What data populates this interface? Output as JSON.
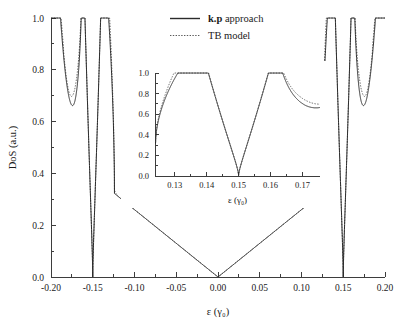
{
  "chart_data": {
    "type": "line",
    "title": "",
    "xlabel": "ε (γ₀)",
    "ylabel": "DoS (a.u.)",
    "xlim": [
      -0.2,
      0.2
    ],
    "ylim": [
      0.0,
      1.0
    ],
    "xticks": [
      -0.2,
      -0.15,
      -0.1,
      -0.05,
      0.0,
      0.05,
      0.1,
      0.15,
      0.2
    ],
    "xticklabels": [
      "-0.20",
      "-0.15",
      "-0.10",
      "-0.05",
      "0.00",
      "0.05",
      "0.10",
      "0.15",
      "0.20"
    ],
    "yticks": [
      0.0,
      0.2,
      0.4,
      0.6,
      0.8,
      1.0
    ],
    "yticklabels": [
      "0.0",
      "0.2",
      "0.4",
      "0.6",
      "0.8",
      "1.0"
    ],
    "minor_xticks_per_interval": 1,
    "minor_yticks_per_interval": 1,
    "grid": false,
    "legend_position": "top-center",
    "series": [
      {
        "name": "k.p approach",
        "name_rich": [
          "k.p",
          " approach"
        ],
        "style": "solid",
        "color": "#2b2b2b"
      },
      {
        "name": "TB model",
        "name_rich": [
          "",
          "TB model"
        ],
        "style": "dotted",
        "color": "#5a5a5a"
      }
    ],
    "model": {
      "description": "Density of states of a semiconducting carbon nanotube: linear V from Dirac point, van Hove singularities at subband edges, zero at gap-like band crossings.",
      "dirac_slope": 2.6,
      "linear_region": [
        -0.125,
        0.125
      ],
      "singularities": [
        {
          "center": 0.136,
          "zero_at": 0.15,
          "plateau": 0.455,
          "side": "low"
        },
        {
          "center": 0.1638,
          "zero_at": 0.15,
          "plateau": 0.615,
          "side": "high"
        },
        {
          "center": 0.19,
          "zero_at": 0.2035,
          "plateau": 0.585,
          "side": "low"
        }
      ],
      "edge_value_at_0p20": 0.633,
      "tb_offset_scale": 0.035
    },
    "inset": {
      "xlabel": "ε (γ₀)",
      "xlim": [
        0.1238,
        0.1755
      ],
      "ylim": [
        0.0,
        1.0
      ],
      "xticks": [
        0.13,
        0.14,
        0.15,
        0.16,
        0.17
      ],
      "xticklabels": [
        "0.13",
        "0.14",
        "0.15",
        "0.16",
        "0.17"
      ],
      "yticks": [
        0.0,
        0.2,
        0.4,
        0.6,
        0.8,
        1.0
      ],
      "yticklabels": [
        "0.0",
        "0.2",
        "0.4",
        "0.6",
        "0.8",
        "1.0"
      ],
      "grid": false,
      "left_value": 0.455,
      "right_value": 0.615
    }
  },
  "legend": {
    "items": [
      {
        "bold": "k.p",
        "rest": " approach",
        "style": "solid"
      },
      {
        "bold": "",
        "rest": "TB model",
        "style": "dotted"
      }
    ]
  }
}
